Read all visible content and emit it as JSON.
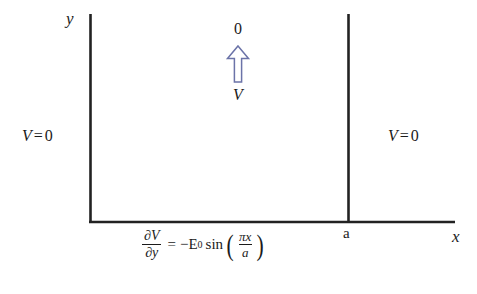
{
  "figure": {
    "background_color": "#ffffff",
    "line_color": "#222222",
    "text_color": "#1b1b1b",
    "arrow_color": "#6b73a8"
  },
  "axes": {
    "y_label": "y",
    "x_label": "x",
    "tick_label_a": "a"
  },
  "boundaries": {
    "left": {
      "symbol": "V",
      "equals": "=",
      "value": "0"
    },
    "right": {
      "symbol": "V",
      "equals": "=",
      "value": "0"
    }
  },
  "arrow_annotation": {
    "top_label": "0",
    "bottom_label": "V",
    "icon": "up-arrow-outline"
  },
  "equation": {
    "lhs": {
      "numerator": "∂V",
      "denominator": "∂y"
    },
    "operator": "=",
    "rhs": {
      "sign": "−",
      "amplitude_symbol": "E",
      "amplitude_subscript": "0",
      "function": "sin",
      "open_paren": "(",
      "close_paren": ")",
      "argument": {
        "numerator": "πx",
        "denominator": "a"
      }
    },
    "plain_text": "∂V/∂y = −E₀ sin(πx/a)"
  }
}
